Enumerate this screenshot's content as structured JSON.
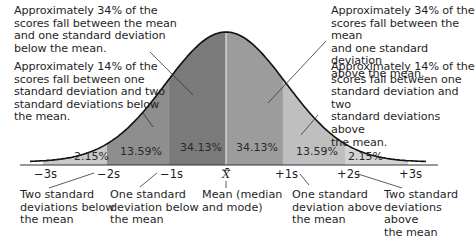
{
  "chart_data": {
    "type": "area",
    "title": "",
    "x_ticks": [
      "-3s",
      "-2s",
      "-1s",
      "X̄",
      "+1s",
      "+2s",
      "+3s"
    ],
    "bands": [
      {
        "from": "-3s",
        "to": "-2s",
        "percent": 2.15,
        "label": "2.15%",
        "color": "#c9c9c9"
      },
      {
        "from": "-2s",
        "to": "-1s",
        "percent": 13.59,
        "label": "13.59%",
        "color": "#8e8e8e"
      },
      {
        "from": "-1s",
        "to": "X̄",
        "percent": 34.13,
        "label": "34.13%",
        "color": "#7a7a7a"
      },
      {
        "from": "X̄",
        "to": "+1s",
        "percent": 34.13,
        "label": "34.13%",
        "color": "#9c9c9c"
      },
      {
        "from": "+1s",
        "to": "+2s",
        "percent": 13.59,
        "label": "13.59%",
        "color": "#bfbfbf"
      },
      {
        "from": "+2s",
        "to": "+3s",
        "percent": 2.15,
        "label": "2.15%",
        "color": "#d3d3d3"
      }
    ],
    "grid": false,
    "legend": "none"
  },
  "annotations": {
    "top_left": "Approximately 34% of the\nscores fall between the mean\nand one standard deviation\nbelow the mean.",
    "mid_left": "Approximately 14% of the\nscores fall between one\nstandard deviation and two\nstandard deviations below\nthe mean.",
    "top_right": "Approximately 34% of the\nscores fall between the mean\nand one standard deviation\nabove the mean.",
    "mid_right": "Approximately 14% of the\nscores fall between one\nstandard deviation and two\nstandard deviations above\nthe mean."
  },
  "ticks": {
    "m3": "−3s",
    "m2": "−2s",
    "m1": "−1s",
    "mean": "X̄",
    "p1": "+1s",
    "p2": "+2s",
    "p3": "+3s"
  },
  "percent_labels": {
    "b1": "2.15%",
    "b2": "13.59%",
    "b3": "34.13%",
    "b4": "34.13%",
    "b5": "13.59%",
    "b6": "2.15%"
  },
  "captions": {
    "two_below": "Two standard\ndeviations below\nthe mean",
    "one_below": "One standard\ndeviation below\nthe mean",
    "mean": "Mean (median\nand mode)",
    "one_above": "One standard\ndeviation above\nthe mean",
    "two_above": "Two standard\ndeviations above\nthe mean"
  }
}
